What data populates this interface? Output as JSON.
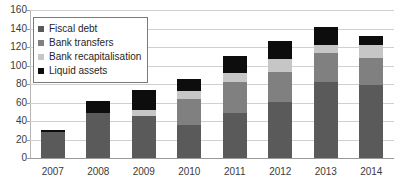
{
  "chart_data": {
    "type": "bar",
    "subtype": "stacked-bar",
    "title": "",
    "subtitle": "",
    "xlabel": "",
    "ylabel": "",
    "ylim": [
      0,
      160
    ],
    "ytick_step": 20,
    "yticks": [
      160,
      140,
      120,
      100,
      80,
      60,
      40,
      20,
      0
    ],
    "grid": true,
    "grid_axis": "y",
    "legend_position": "top-left",
    "categories": [
      "2007",
      "2008",
      "2009",
      "2010",
      "2011",
      "2012",
      "2013",
      "2014"
    ],
    "series": [
      {
        "name": "Fiscal debt",
        "color": "#5a5a5a",
        "values": [
          28,
          49,
          45,
          36,
          49,
          61,
          82,
          79
        ]
      },
      {
        "name": "Bank transfers",
        "color": "#808080",
        "values": [
          0,
          0,
          0,
          28,
          33,
          32,
          31,
          29
        ]
      },
      {
        "name": "Bank recapitalisation",
        "color": "#c6c6c6",
        "values": [
          0,
          0,
          7,
          8,
          10,
          14,
          9,
          14
        ]
      },
      {
        "name": "Liquid assets",
        "color": "#0d0d0d",
        "values": [
          2,
          13,
          21,
          13,
          18,
          19,
          20,
          10
        ]
      }
    ],
    "totals": [
      30,
      62,
      73,
      85,
      110,
      126,
      142,
      132
    ]
  },
  "legend": {
    "items": [
      {
        "label": "Fiscal debt",
        "color": "#5a5a5a"
      },
      {
        "label": "Bank transfers",
        "color": "#808080"
      },
      {
        "label": "Bank recapitalisation",
        "color": "#c6c6c6"
      },
      {
        "label": "Liquid assets",
        "color": "#0d0d0d"
      }
    ]
  }
}
